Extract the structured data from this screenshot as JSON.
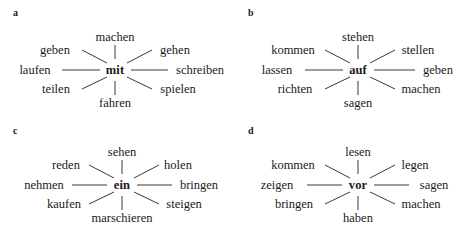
{
  "figure": {
    "background_color": "#ffffff",
    "text_color": "#1a1a1a",
    "line_color": "#26221f"
  },
  "panels": [
    {
      "label": "a",
      "hub": "mit",
      "spokes": {
        "top": "machen",
        "top_left": "geben",
        "left": "laufen",
        "bottom_left": "teilen",
        "bottom": "fahren",
        "bottom_right": "spielen",
        "right": "schreiben",
        "top_right": "gehen"
      }
    },
    {
      "label": "b",
      "hub": "auf",
      "spokes": {
        "top": "stehen",
        "top_left": "kommen",
        "left": "lassen",
        "bottom_left": "richten",
        "bottom": "sagen",
        "bottom_right": "machen",
        "right": "geben",
        "top_right": "stellen"
      }
    },
    {
      "label": "c",
      "hub": "ein",
      "spokes": {
        "top": "sehen",
        "top_left": "reden",
        "left": "nehmen",
        "bottom_left": "kaufen",
        "bottom": "marschieren",
        "bottom_right": "steigen",
        "right": "bringen",
        "top_right": "holen"
      }
    },
    {
      "label": "d",
      "hub": "vor",
      "spokes": {
        "top": "lesen",
        "top_left": "kommen",
        "left": "zeigen",
        "bottom_left": "bringen",
        "bottom": "haben",
        "bottom_right": "machen",
        "right": "sagen",
        "top_right": "legen"
      }
    }
  ]
}
